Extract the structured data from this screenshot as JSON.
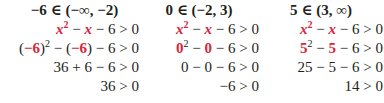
{
  "accent_color": "#d7263d",
  "columns": [
    {
      "header": "−6 ∈ (−∞, −2)",
      "test_value": "−6",
      "rows": [
        "x² − x − 6 > 0",
        "(−6)² − (−6) − 6 > 0",
        "36 + 6 − 6 > 0",
        "36 > 0"
      ],
      "r3": "36 + 6 − 6 > 0",
      "r4": "36 > 0"
    },
    {
      "header": "0 ∈ (−2, 3)",
      "test_value": "0",
      "rows": [
        "x² − x − 6 > 0",
        "0² − 0 − 6 > 0",
        "0 − 0 − 6 > 0",
        "−6 > 0"
      ],
      "r3": "0 − 0 − 6 > 0",
      "r4": "−6 > 0"
    },
    {
      "header": "5 ∈ (3, ∞)",
      "test_value": "5",
      "rows": [
        "x² − x − 6 > 0",
        "5² − 5 − 6 > 0",
        "25 − 5 − 6 > 0",
        "14 > 0"
      ],
      "r3": "25 − 5 − 6 > 0",
      "r4": "14 > 0"
    }
  ],
  "parts": {
    "x": "x",
    "sq": "2",
    "minus": " − ",
    "tail": " − 6 > 0",
    "c1_open": "(−6)",
    "c1_mid": " − ",
    "c1_paren_open": "(",
    "c1_val": "−6",
    "c1_paren_close": ")",
    "c2_val": "0",
    "c3_val": "5"
  }
}
